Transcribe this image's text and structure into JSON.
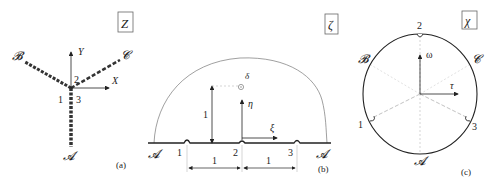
{
  "panels": {
    "a": {
      "plane_label": "Z",
      "caption": "(a)",
      "axes": {
        "x": "X",
        "y": "Y"
      },
      "branches": [
        "𝓐",
        "𝓑",
        "𝓒"
      ],
      "vertex_labels": [
        "1",
        "2",
        "3"
      ]
    },
    "b": {
      "plane_label": "ζ",
      "caption": "(b)",
      "axes": {
        "x": "ξ",
        "y": "η"
      },
      "endpoints": [
        "𝓐",
        "𝓐"
      ],
      "point_labels": [
        "1",
        "2",
        "3"
      ],
      "pole_label": "δ",
      "height_label": "1",
      "spacing_labels": [
        "1",
        "1"
      ]
    },
    "c": {
      "plane_label": "χ",
      "caption": "(c)",
      "axes": {
        "x": "τ",
        "y": "ω"
      },
      "arc_labels": [
        "𝓐",
        "𝓑",
        "𝓒"
      ],
      "point_labels": [
        "1",
        "2",
        "3"
      ]
    }
  },
  "colors": {
    "ink": "#222222",
    "light": "#bbbbbb",
    "box": "#666666"
  }
}
